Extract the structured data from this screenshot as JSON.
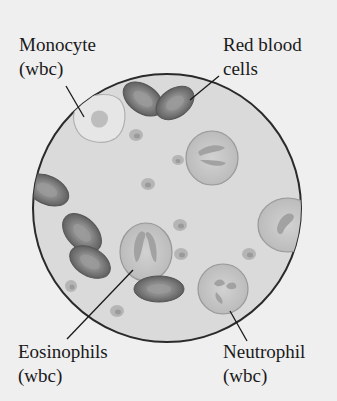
{
  "diagram": {
    "labels": {
      "monocyte": {
        "line1": "Monocyte",
        "line2": "(wbc)"
      },
      "red_blood_cells": {
        "line1": "Red blood",
        "line2": "cells"
      },
      "eosinophils": {
        "line1": "Eosinophils",
        "line2": "(wbc)"
      },
      "neutrophil": {
        "line1": "Neutrophil",
        "line2": "(wbc)"
      }
    },
    "colors": {
      "background": "#efefef",
      "field": "#d9d9d9",
      "outline": "#2a2a2a",
      "rbc": "#7a7a7a",
      "wbc": "#c4c4c4",
      "nucleus": "#a6a6a6"
    }
  }
}
